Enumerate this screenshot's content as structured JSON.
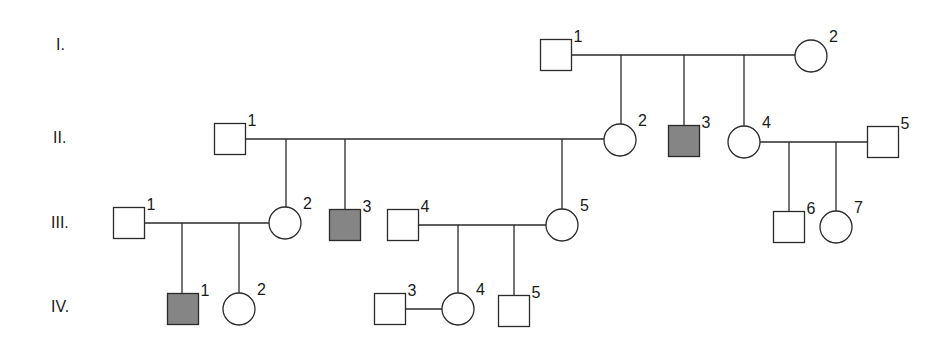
{
  "diagram": {
    "type": "pedigree",
    "colors": {
      "affected": "#858585",
      "unaffected": "#ffffff",
      "stroke": "#2a2a2a"
    },
    "generations": [
      {
        "id": "I",
        "label": "I."
      },
      {
        "id": "II",
        "label": "II."
      },
      {
        "id": "III",
        "label": "III."
      },
      {
        "id": "IV",
        "label": "IV."
      }
    ],
    "individuals": [
      {
        "id": "I-1",
        "gen": "I",
        "num": "1",
        "sex": "male",
        "affected": false
      },
      {
        "id": "I-2",
        "gen": "I",
        "num": "2",
        "sex": "female",
        "affected": false
      },
      {
        "id": "II-1",
        "gen": "II",
        "num": "1",
        "sex": "male",
        "affected": false
      },
      {
        "id": "II-2",
        "gen": "II",
        "num": "2",
        "sex": "female",
        "affected": false
      },
      {
        "id": "II-3",
        "gen": "II",
        "num": "3",
        "sex": "male",
        "affected": true
      },
      {
        "id": "II-4",
        "gen": "II",
        "num": "4",
        "sex": "female",
        "affected": false
      },
      {
        "id": "II-5",
        "gen": "II",
        "num": "5",
        "sex": "male",
        "affected": false
      },
      {
        "id": "III-1",
        "gen": "III",
        "num": "1",
        "sex": "male",
        "affected": false
      },
      {
        "id": "III-2",
        "gen": "III",
        "num": "2",
        "sex": "female",
        "affected": false
      },
      {
        "id": "III-3",
        "gen": "III",
        "num": "3",
        "sex": "male",
        "affected": true
      },
      {
        "id": "III-4",
        "gen": "III",
        "num": "4",
        "sex": "male",
        "affected": false
      },
      {
        "id": "III-5",
        "gen": "III",
        "num": "5",
        "sex": "female",
        "affected": false
      },
      {
        "id": "III-6",
        "gen": "III",
        "num": "6",
        "sex": "male",
        "affected": false
      },
      {
        "id": "III-7",
        "gen": "III",
        "num": "7",
        "sex": "female",
        "affected": false
      },
      {
        "id": "IV-1",
        "gen": "IV",
        "num": "1",
        "sex": "male",
        "affected": true
      },
      {
        "id": "IV-2",
        "gen": "IV",
        "num": "2",
        "sex": "female",
        "affected": false
      },
      {
        "id": "IV-3",
        "gen": "IV",
        "num": "3",
        "sex": "male",
        "affected": false
      },
      {
        "id": "IV-4",
        "gen": "IV",
        "num": "4",
        "sex": "female",
        "affected": false
      },
      {
        "id": "IV-5",
        "gen": "IV",
        "num": "5",
        "sex": "male",
        "affected": false
      }
    ],
    "matings": [
      {
        "partners": [
          "I-1",
          "I-2"
        ],
        "children": [
          "II-2",
          "II-3",
          "II-4"
        ]
      },
      {
        "partners": [
          "II-1",
          "II-2"
        ],
        "children": [
          "III-2",
          "III-3",
          "III-5"
        ]
      },
      {
        "partners": [
          "II-4",
          "II-5"
        ],
        "children": [
          "III-6",
          "III-7"
        ]
      },
      {
        "partners": [
          "III-1",
          "III-2"
        ],
        "children": [
          "IV-1",
          "IV-2"
        ]
      },
      {
        "partners": [
          "III-4",
          "III-5"
        ],
        "children": [
          "IV-4",
          "IV-5"
        ]
      },
      {
        "partners": [
          "IV-3",
          "IV-4"
        ],
        "children": []
      }
    ]
  }
}
